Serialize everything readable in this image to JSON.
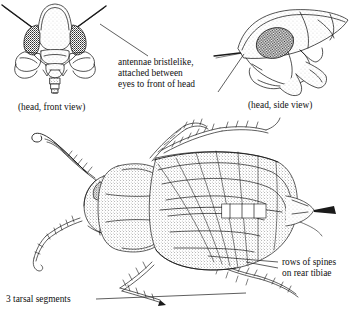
{
  "figure": {
    "style": "pen-and-ink stipple scientific illustration",
    "background_color": "#ffffff",
    "ink_color": "#1a1a1a"
  },
  "annotations": {
    "antennae": {
      "line1": "antennae bristlelike,",
      "line2": "attached between",
      "line3": "eyes to front of head"
    },
    "spines": {
      "line1": "rows of spines",
      "line2": "on rear tibiae"
    },
    "tarsal": {
      "text": "3 tarsal segments"
    }
  },
  "captions": {
    "head_front": "(head, front view)",
    "head_side": "(head, side view)"
  }
}
